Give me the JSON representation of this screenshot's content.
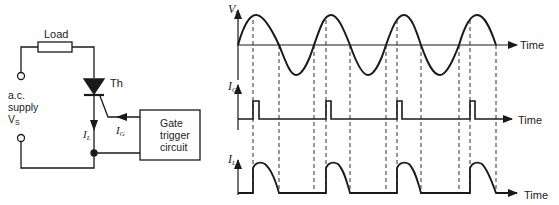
{
  "circuit": {
    "load_label": "Load",
    "thyristor_label": "Th",
    "supply_label_line1": "a.c.",
    "supply_label_line2": "supply",
    "supply_label_line3": "V",
    "supply_label_sub": "S",
    "load_current_label": "I",
    "load_current_sub": "L",
    "gate_current_label": "I",
    "gate_current_sub": "G",
    "gate_box_line1": "Gate",
    "gate_box_line2": "trigger",
    "gate_box_line3": "circuit"
  },
  "waveforms": {
    "vs_label": "V",
    "vs_sub": "S",
    "ig_label": "I",
    "ig_sub": "G",
    "il_label": "I",
    "il_sub": "L",
    "time_label": "Time"
  },
  "colors": {
    "line": "#1a1a1a",
    "background": "#ffffff"
  }
}
